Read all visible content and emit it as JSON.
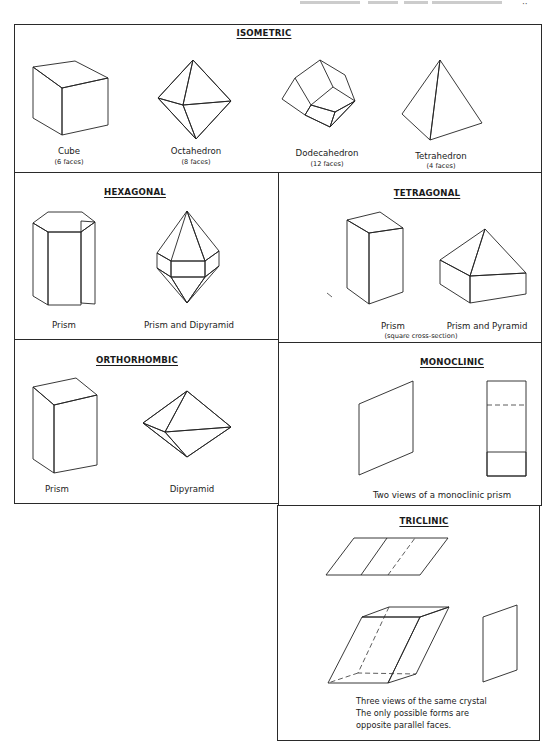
{
  "page": {
    "running_header": "· · · , and minerals",
    "page_number": "··"
  },
  "colors": {
    "ink": "#222222",
    "paper": "#ffffff",
    "shade_light": "#d4d4d4",
    "shade_dark": "#6e6e6e"
  },
  "sections": {
    "isometric": {
      "title": "ISOMETRIC",
      "figures": [
        {
          "name": "Cube",
          "faces": "(6 faces)"
        },
        {
          "name": "Octahedron",
          "faces": "(8 faces)"
        },
        {
          "name": "Dodecahedron",
          "faces": "(12 faces)"
        },
        {
          "name": "Tetrahedron",
          "faces": "(4 faces)"
        }
      ]
    },
    "hexagonal": {
      "title": "HEXAGONAL",
      "figures": [
        {
          "name": "Prism"
        },
        {
          "name": "Prism and Dipyramid"
        }
      ]
    },
    "tetragonal": {
      "title": "TETRAGONAL",
      "figures": [
        {
          "name": "Prism",
          "note": "(square cross-section)"
        },
        {
          "name": "Prism and Pyramid"
        }
      ]
    },
    "orthorhombic": {
      "title": "ORTHORHOMBIC",
      "figures": [
        {
          "name": "Prism"
        },
        {
          "name": "Dipyramid"
        }
      ]
    },
    "monoclinic": {
      "title": "MONOCLINIC",
      "caption": "Two views of a monoclinic prism"
    },
    "triclinic": {
      "title": "TRICLINIC",
      "caption_lines": [
        "Three views of the same crystal",
        "The only possible forms are",
        "opposite parallel faces."
      ]
    }
  }
}
